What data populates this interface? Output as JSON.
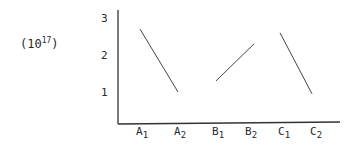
{
  "chart_data": {
    "type": "line",
    "title": "",
    "unit_label": "(10^17)",
    "unit_base": "10",
    "unit_exponent": "17",
    "xlabel": "",
    "ylabel": "(10^17)",
    "categories": [
      "A1",
      "A2",
      "B1",
      "B2",
      "C1",
      "C2"
    ],
    "yticks": [
      1,
      2,
      3
    ],
    "ylim": [
      0,
      3.2
    ],
    "grid": false,
    "legend": null,
    "series": [
      {
        "name": "A",
        "x": [
          "A1",
          "A2"
        ],
        "values": [
          2.7,
          1.0
        ]
      },
      {
        "name": "B",
        "x": [
          "B1",
          "B2"
        ],
        "values": [
          1.3,
          2.3
        ]
      },
      {
        "name": "C",
        "x": [
          "C1",
          "C2"
        ],
        "values": [
          2.6,
          0.95
        ]
      }
    ]
  }
}
